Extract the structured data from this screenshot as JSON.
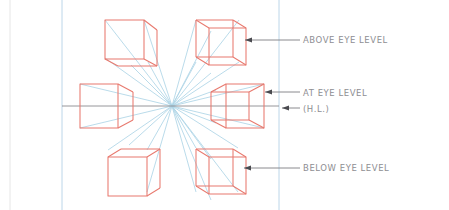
{
  "page": {
    "background_color": "#ffffff",
    "width": 449,
    "height": 210
  },
  "colors": {
    "cube_stroke": "#e8796e",
    "ray_stroke": "#aed4e6",
    "leader_stroke": "#7d7d82",
    "horizon_stroke": "#8a8a8f",
    "margin_rule": "#b9d4e8",
    "page_edge": "#e3e3e3",
    "label_text": "#8e8e93"
  },
  "annotations": {
    "above": {
      "label": "ABOVE EYE LEVEL",
      "arrow": "leader-arrow-left"
    },
    "at": {
      "label": "AT EYE LEVEL",
      "arrow": "leader-arrow-left"
    },
    "horizon_abbrev": {
      "label": "(H.L.)",
      "arrow": "leader-arrow-left"
    },
    "below": {
      "label": "BELOW EYE LEVEL",
      "arrow": "leader-arrow-left"
    }
  },
  "construction": {
    "vanishing_point": {
      "x": 172,
      "y": 106
    },
    "horizon_line": {
      "y": 106,
      "x_start": 62,
      "x_end": 279
    },
    "margin_left_x": 62,
    "margin_right_x": 279,
    "page_edge_x": 10
  },
  "cubes": [
    {
      "name": "cube-top-left",
      "position": "above-eye-level-left",
      "faces_visible": "front, right, bottom"
    },
    {
      "name": "cube-top-right",
      "position": "above-eye-level-right",
      "faces_visible": "front, left, bottom"
    },
    {
      "name": "cube-middle-left",
      "position": "at-eye-level-left",
      "faces_visible": "front, right"
    },
    {
      "name": "cube-middle-right",
      "position": "at-eye-level-right",
      "faces_visible": "front, left"
    },
    {
      "name": "cube-bottom-left",
      "position": "below-eye-level-left",
      "faces_visible": "front, top, right"
    },
    {
      "name": "cube-bottom-right",
      "position": "below-eye-level-right",
      "faces_visible": "front, top, left"
    }
  ]
}
